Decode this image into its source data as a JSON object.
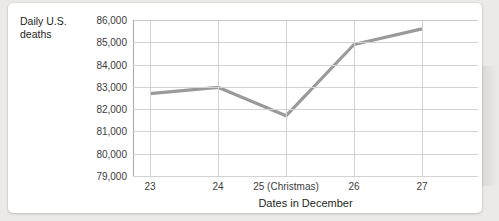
{
  "chart_data": {
    "type": "line",
    "title": "",
    "ylabel": "Daily U.S.\ndeaths",
    "ylabel_line1": "Daily U.S.",
    "ylabel_line2": "deaths",
    "xlabel": "Dates in December",
    "categories": [
      "23",
      "24",
      "25 (Christmas)",
      "26",
      "27"
    ],
    "x": [
      23,
      24,
      25,
      26,
      27
    ],
    "values": [
      82700,
      82980,
      81700,
      84900,
      85600
    ],
    "series": [
      {
        "name": "Daily U.S. deaths",
        "values": [
          82700,
          82980,
          81700,
          84900,
          85600
        ],
        "color": "#9a9a9a"
      }
    ],
    "ylim": [
      79000,
      86000
    ],
    "yticks": [
      86000,
      85000,
      84000,
      83000,
      82000,
      81000,
      80000,
      79000
    ],
    "ytick_labels": [
      "86,000",
      "85,000",
      "84,000",
      "83,000",
      "82,000",
      "81,000",
      "80,000",
      "79,000"
    ],
    "grid": true,
    "legend": false,
    "legend_position": "none"
  },
  "colors": {
    "line": "#9a9a9a",
    "gridline": "#d2d2d2",
    "axis": "#a8a8a8",
    "text": "#231f20",
    "tick_text": "#3c3c3c",
    "card_background": "#ffffff",
    "page_background": "#eceae8"
  }
}
